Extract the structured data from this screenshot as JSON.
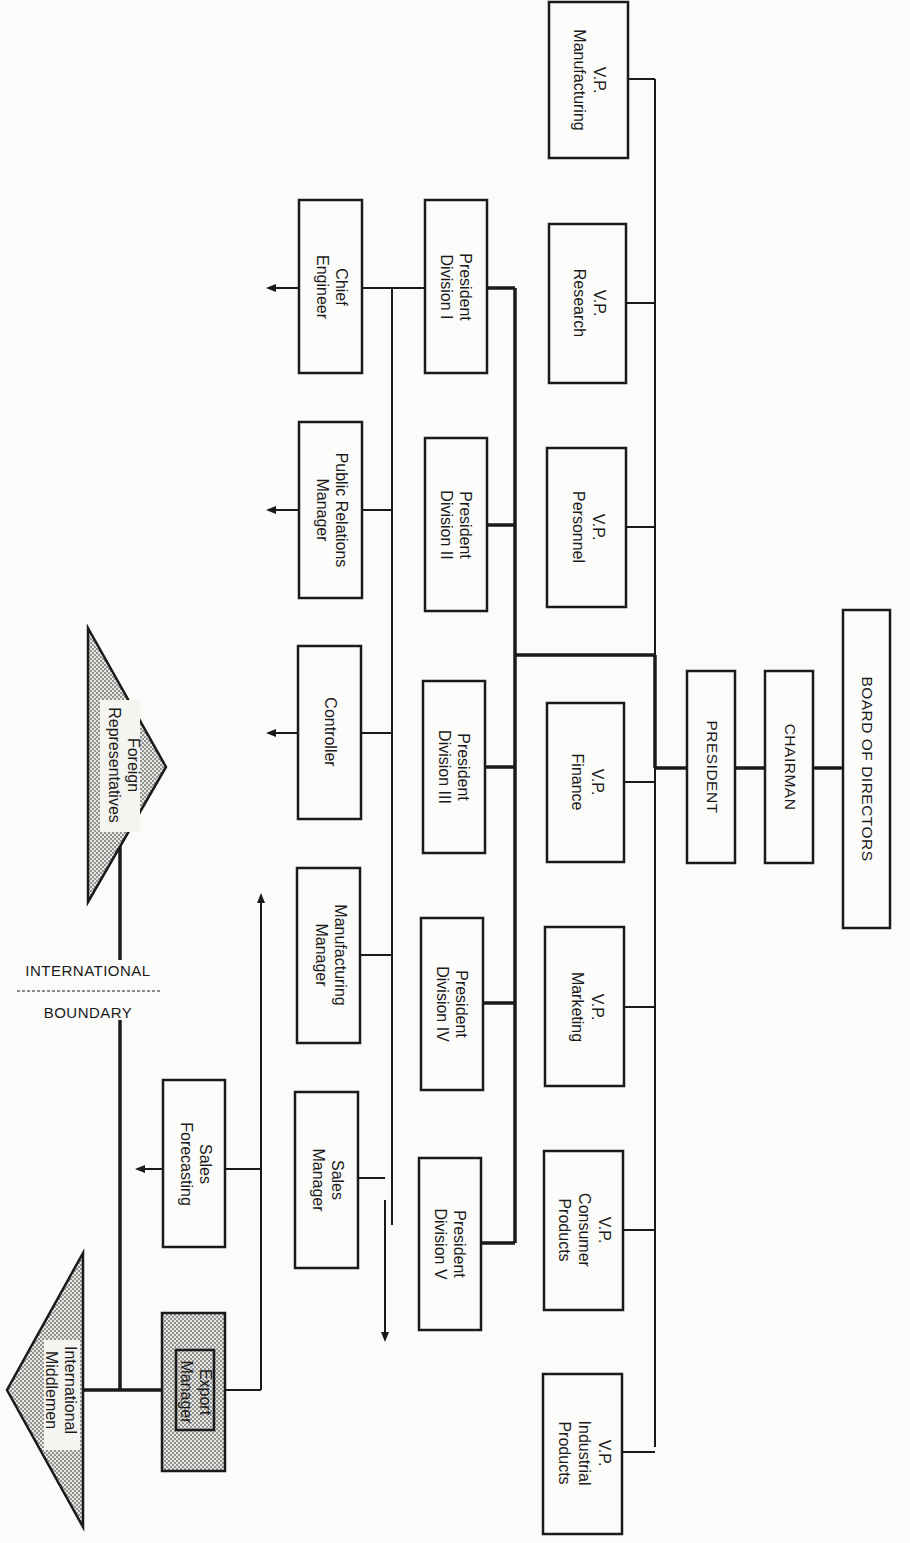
{
  "diagram": {
    "type": "organization-chart",
    "orientation": "rotated-90-clockwise",
    "top": {
      "board": "BOARD OF DIRECTORS",
      "chairman": "CHAIRMAN",
      "president": "PRESIDENT"
    },
    "vice_presidents": [
      {
        "line1": "V.P.",
        "line2": "Manufacturing",
        "line3": ""
      },
      {
        "line1": "V.P.",
        "line2": "Research",
        "line3": ""
      },
      {
        "line1": "V.P.",
        "line2": "Personnel",
        "line3": ""
      },
      {
        "line1": "V.P.",
        "line2": "Finance",
        "line3": ""
      },
      {
        "line1": "V.P.",
        "line2": "Marketing",
        "line3": ""
      },
      {
        "line1": "V.P.",
        "line2": "Consumer",
        "line3": "Products"
      },
      {
        "line1": "V.P.",
        "line2": "Industrial",
        "line3": "Products"
      }
    ],
    "division_presidents": [
      {
        "line1": "President",
        "line2": "Division I"
      },
      {
        "line1": "President",
        "line2": "Division II"
      },
      {
        "line1": "President",
        "line2": "Division III"
      },
      {
        "line1": "President",
        "line2": "Division IV"
      },
      {
        "line1": "President",
        "line2": "Division V"
      }
    ],
    "division_staff": [
      {
        "line1": "Chief",
        "line2": "Engineer"
      },
      {
        "line1": "Public Relations",
        "line2": "Manager"
      },
      {
        "line1": "Controller",
        "line2": ""
      },
      {
        "line1": "Manufacturing",
        "line2": "Manager"
      },
      {
        "line1": "Sales",
        "line2": "Manager"
      }
    ],
    "international": {
      "sales_forecasting": {
        "line1": "Sales",
        "line2": "Forecasting"
      },
      "export_manager": {
        "line1": "Export",
        "line2": "Manager"
      },
      "foreign_reps": {
        "line1": "Foreign",
        "line2": "Representatives"
      },
      "middlemen": {
        "line1": "International",
        "line2": "Middlemen"
      },
      "boundary_top": "INTERNATIONAL",
      "boundary_bottom": "BOUNDARY"
    }
  }
}
